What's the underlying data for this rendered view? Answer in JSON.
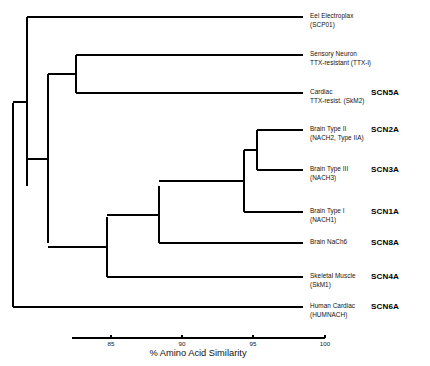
{
  "figure": {
    "kind": "phylogenetic-tree",
    "background": "#ffffff",
    "line_color": "#000000"
  },
  "chart_data": {
    "type": "tree",
    "title": "",
    "xlabel": "% Amino Acid Similarity",
    "ylabel": "",
    "xlim": [
      83.2,
      100.0
    ],
    "ticks": [
      85,
      90,
      95,
      100
    ],
    "tick_labels": [
      "85",
      "90",
      "95",
      "100"
    ],
    "grid": false,
    "legend": "none",
    "axis_px": {
      "x_left": 72,
      "x_right": 325,
      "y": 338
    },
    "leaves": [
      {
        "id": "SCP01",
        "name_line1": "Eel Electroplax",
        "name_line2": "(SCP01)",
        "code": "",
        "y_px": 17,
        "branch_x_px": 303,
        "parent_x_px": 27
      },
      {
        "id": "TTXi",
        "name_line1": "Sensory Neuron",
        "name_line2": "TTX-resistant (TTX-i)",
        "code": "",
        "y_px": 55,
        "branch_x_px": 303,
        "parent_x_px": 76
      },
      {
        "id": "SCN5A",
        "name_line1": "Cardiac",
        "name_line2": "TTX-resist. (SkM2)",
        "code": "SCN5A",
        "y_px": 93,
        "branch_x_px": 303,
        "parent_x_px": 76
      },
      {
        "id": "SCN2A",
        "name_line1": "Brain Type II",
        "name_line2": "(NACH2, Type IIA)",
        "code": "SCN2A",
        "y_px": 130,
        "branch_x_px": 303,
        "parent_x_px": 257
      },
      {
        "id": "SCN3A",
        "name_line1": "Brain Type III",
        "name_line2": "(NACH3)",
        "code": "SCN3A",
        "y_px": 170,
        "branch_x_px": 303,
        "parent_x_px": 257
      },
      {
        "id": "SCN1A",
        "name_line1": "Brain Type I",
        "name_line2": "(NACH1)",
        "code": "SCN1A",
        "y_px": 212,
        "branch_x_px": 303,
        "parent_x_px": 244
      },
      {
        "id": "SCN8A",
        "name_line1": "Brain NaCh6",
        "name_line2": "",
        "code": "SCN8A",
        "y_px": 243,
        "branch_x_px": 303,
        "parent_x_px": 159
      },
      {
        "id": "SCN4A",
        "name_line1": "Skeletal Muscle",
        "name_line2": "(SkM1)",
        "code": "SCN4A",
        "y_px": 277,
        "branch_x_px": 303,
        "parent_x_px": 107
      },
      {
        "id": "SCN6A",
        "name_line1": "Human Cardiac",
        "name_line2": "(HUMNACH)",
        "code": "SCN6A",
        "y_px": 307,
        "branch_x_px": 303,
        "parent_x_px": 13
      }
    ],
    "nodes": [
      {
        "id": "root",
        "x_px": 13,
        "y_top_px": 103,
        "y_bot_px": 307,
        "parent_x_px": null
      },
      {
        "id": "n1",
        "x_px": 27,
        "y_top_px": 17,
        "y_bot_px": 186,
        "parent_x_px": 13
      },
      {
        "id": "n2",
        "x_px": 48,
        "y_top_px": 74,
        "y_bot_px": 243,
        "parent_x_px": 27
      },
      {
        "id": "n3",
        "x_px": 76,
        "y_top_px": 55,
        "y_bot_px": 93,
        "parent_x_px": 48
      },
      {
        "id": "n4",
        "x_px": 107,
        "y_top_px": 217,
        "y_bot_px": 277,
        "parent_x_px": 48
      },
      {
        "id": "n5",
        "x_px": 159,
        "y_top_px": 186,
        "y_bot_px": 243,
        "parent_x_px": 107
      },
      {
        "id": "n6",
        "x_px": 244,
        "y_top_px": 150,
        "y_bot_px": 212,
        "parent_x_px": 159
      },
      {
        "id": "n7",
        "x_px": 257,
        "y_top_px": 130,
        "y_bot_px": 170,
        "parent_x_px": 244
      }
    ]
  },
  "axis": {
    "title": "% Amino Acid Similarity",
    "ticks": [
      {
        "label": "85",
        "x_px": 111
      },
      {
        "label": "90",
        "x_px": 182
      },
      {
        "label": "95",
        "x_px": 253
      },
      {
        "label": "100",
        "x_px": 325
      }
    ]
  }
}
